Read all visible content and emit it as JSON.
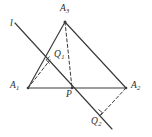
{
  "figure": {
    "type": "geometry-diagram",
    "canvas": {
      "width": 152,
      "height": 137
    },
    "stroke_color": "#3a3a3a",
    "label_color": "#2b2b2b",
    "background": "#ffffff",
    "points": [
      {
        "id": "A1",
        "label": "A",
        "sub": "1",
        "x": 28,
        "y": 88,
        "label_x": 11,
        "label_y": 82
      },
      {
        "id": "A2",
        "label": "A",
        "sub": "2",
        "x": 126,
        "y": 88,
        "label_x": 131,
        "label_y": 82
      },
      {
        "id": "A3",
        "label": "A",
        "sub": "3",
        "x": 65,
        "y": 22,
        "label_x": 60,
        "label_y": 6
      },
      {
        "id": "P",
        "label": "P",
        "sub": "",
        "x": 72,
        "y": 88,
        "label_x": 66,
        "label_y": 91
      },
      {
        "id": "Q1",
        "label": "Q",
        "sub": "1",
        "x": 50,
        "y": 60,
        "label_x": 54,
        "label_y": 52
      },
      {
        "id": "Q2",
        "label": "Q",
        "sub": "2",
        "x": 100,
        "y": 116,
        "label_x": 92,
        "label_y": 117
      },
      {
        "id": "l",
        "label": "l",
        "sub": "",
        "x": 15,
        "y": 23,
        "label_x": 10,
        "label_y": 23
      }
    ],
    "solid_segments": [
      {
        "name": "base-A1-A2",
        "x1": 28,
        "y1": 88,
        "x2": 126,
        "y2": 88
      },
      {
        "name": "side-A1-A3",
        "x1": 28,
        "y1": 88,
        "x2": 65,
        "y2": 22
      },
      {
        "name": "side-A3-A2",
        "x1": 65,
        "y1": 22,
        "x2": 126,
        "y2": 88
      },
      {
        "name": "transversal-l",
        "x1": 15,
        "y1": 23,
        "x2": 112,
        "y2": 129
      }
    ],
    "dashed_segments": [
      {
        "name": "perpendicular-A1-Q1",
        "x1": 28,
        "y1": 88,
        "x2": 50,
        "y2": 60
      },
      {
        "name": "perpendicular-A2-Q2",
        "x1": 126,
        "y1": 88,
        "x2": 100,
        "y2": 116
      },
      {
        "name": "median-A3-P",
        "x1": 65,
        "y1": 22,
        "x2": 72,
        "y2": 88
      }
    ],
    "right_angle_marks": [
      {
        "name": "right-angle-at-Q1",
        "vertex_x": 50,
        "vertex_y": 60,
        "size": 6
      },
      {
        "name": "right-angle-at-Q2",
        "vertex_x": 100,
        "vertex_y": 116,
        "size": 6
      }
    ]
  }
}
